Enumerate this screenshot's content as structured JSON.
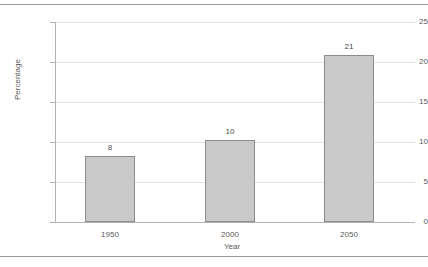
{
  "chart_data": {
    "type": "bar",
    "title": "",
    "categories": [
      "1950",
      "2000",
      "2050"
    ],
    "values": [
      8.3,
      10.2,
      20.9
    ],
    "data_labels": [
      "8",
      "10",
      "21"
    ],
    "xlabel": "Year",
    "ylabel": "Percentage",
    "ylim": [
      0,
      25
    ],
    "yticks": [
      "0",
      "5",
      "10",
      "15",
      "20",
      "25"
    ],
    "grid": "horizontal",
    "legend": "none",
    "bar_fill": "#c9c9c9",
    "bar_border": "#8c8c8c",
    "gridline_color": "#e3e3e3",
    "axis_color": "#b2b2b2",
    "rule_color": "#9a9a9a"
  }
}
